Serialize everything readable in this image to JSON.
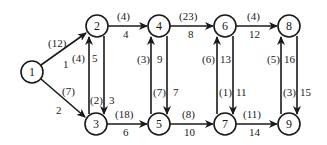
{
  "diagram": {
    "type": "directed-network",
    "nodes": [
      {
        "id": "1",
        "label": "1",
        "x": 32,
        "y": 72
      },
      {
        "id": "2",
        "label": "2",
        "x": 97,
        "y": 26
      },
      {
        "id": "3",
        "label": "3",
        "x": 96,
        "y": 124
      },
      {
        "id": "4",
        "label": "4",
        "x": 159,
        "y": 26
      },
      {
        "id": "5",
        "label": "5",
        "x": 159,
        "y": 124
      },
      {
        "id": "6",
        "label": "6",
        "x": 225,
        "y": 26
      },
      {
        "id": "7",
        "label": "7",
        "x": 225,
        "y": 124
      },
      {
        "id": "8",
        "label": "8",
        "x": 289,
        "y": 26
      },
      {
        "id": "9",
        "label": "9",
        "x": 289,
        "y": 124
      }
    ],
    "edges": [
      {
        "from": "1",
        "to": "2",
        "index": "1",
        "weight": "(12)"
      },
      {
        "from": "1",
        "to": "3",
        "index": "2",
        "weight": "(7)"
      },
      {
        "from": "2",
        "to": "3",
        "index": "3",
        "weight": "(2)"
      },
      {
        "from": "2",
        "to": "4",
        "index": "4",
        "weight": "(4)"
      },
      {
        "from": "3",
        "to": "2",
        "index": "5",
        "weight": "(4)"
      },
      {
        "from": "3",
        "to": "5",
        "index": "6",
        "weight": "(18)"
      },
      {
        "from": "4",
        "to": "5",
        "index": "7",
        "weight": "(7)"
      },
      {
        "from": "4",
        "to": "6",
        "index": "8",
        "weight": "(23)"
      },
      {
        "from": "5",
        "to": "4",
        "index": "9",
        "weight": "(3)"
      },
      {
        "from": "5",
        "to": "7",
        "index": "10",
        "weight": "(8)"
      },
      {
        "from": "6",
        "to": "7",
        "index": "11",
        "weight": "(1)"
      },
      {
        "from": "6",
        "to": "8",
        "index": "12",
        "weight": "(4)"
      },
      {
        "from": "7",
        "to": "6",
        "index": "13",
        "weight": "(6)"
      },
      {
        "from": "7",
        "to": "9",
        "index": "14",
        "weight": "(11)"
      },
      {
        "from": "8",
        "to": "9",
        "index": "15",
        "weight": "(3)"
      },
      {
        "from": "9",
        "to": "8",
        "index": "16",
        "weight": "(5)"
      }
    ]
  },
  "labels": {
    "e1": {
      "w": "(12)",
      "i": "1"
    },
    "e2": {
      "w": "(7)",
      "i": "2"
    },
    "e3": {
      "w": "(2)",
      "i": "3"
    },
    "e4": {
      "w": "(4)",
      "i": "4"
    },
    "e5": {
      "w": "(4)",
      "i": "5"
    },
    "e6": {
      "w": "(18)",
      "i": "6"
    },
    "e7": {
      "w": "(7)",
      "i": "7"
    },
    "e8": {
      "w": "(23)",
      "i": "8"
    },
    "e9": {
      "w": "(3)",
      "i": "9"
    },
    "e10": {
      "w": "(8)",
      "i": "10"
    },
    "e11": {
      "w": "(1)",
      "i": "11"
    },
    "e12": {
      "w": "(4)",
      "i": "12"
    },
    "e13": {
      "w": "(6)",
      "i": "13"
    },
    "e14": {
      "w": "(11)",
      "i": "14"
    },
    "e15": {
      "w": "(3)",
      "i": "15"
    },
    "e16": {
      "w": "(5)",
      "i": "16"
    }
  },
  "node_labels": {
    "n1": "1",
    "n2": "2",
    "n3": "3",
    "n4": "4",
    "n5": "5",
    "n6": "6",
    "n7": "7",
    "n8": "8",
    "n9": "9"
  }
}
